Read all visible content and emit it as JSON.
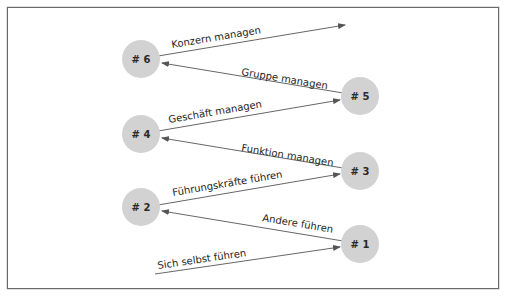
{
  "diagram": {
    "colors": {
      "node_fill": "#d2d2d2",
      "edge_stroke": "#555555",
      "frame_border": "#6a6a6a"
    },
    "nodes": [
      {
        "id": "n1",
        "label": "# 1",
        "cx": 360,
        "cy": 244
      },
      {
        "id": "n2",
        "label": "# 2",
        "cx": 141,
        "cy": 207
      },
      {
        "id": "n3",
        "label": "# 3",
        "cx": 360,
        "cy": 171
      },
      {
        "id": "n4",
        "label": "# 4",
        "cx": 141,
        "cy": 134
      },
      {
        "id": "n5",
        "label": "# 5",
        "cx": 360,
        "cy": 96
      },
      {
        "id": "n6",
        "label": "# 6",
        "cx": 141,
        "cy": 59
      }
    ],
    "edges": [
      {
        "label": "Sich selbst führen",
        "from": "start",
        "to": "n1"
      },
      {
        "label": "Andere führen",
        "from": "n1",
        "to": "n2"
      },
      {
        "label": "Führungskräfte führen",
        "from": "n2",
        "to": "n3"
      },
      {
        "label": "Funktion managen",
        "from": "n3",
        "to": "n4"
      },
      {
        "label": "Geschäft managen",
        "from": "n4",
        "to": "n5"
      },
      {
        "label": "Gruppe managen",
        "from": "n5",
        "to": "n6"
      },
      {
        "label": "Konzern managen",
        "from": "n6",
        "to": "end"
      }
    ]
  }
}
